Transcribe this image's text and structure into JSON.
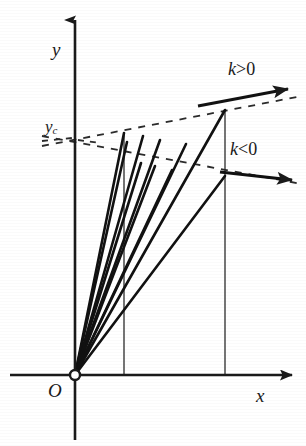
{
  "figure": {
    "background": "#ffffff",
    "ink_color": "#1a1a1a",
    "width": 306,
    "height": 446
  },
  "labels": {
    "y_axis": "y",
    "x_axis": "x",
    "origin": "O",
    "y_c": "y",
    "y_c_subscript": "c",
    "k_positive": "k>0",
    "k_positive_symbol": "k",
    "k_positive_operator": ">",
    "k_positive_value": "0",
    "k_negative": "k<0",
    "k_negative_symbol": "k",
    "k_negative_operator": "<",
    "k_negative_value": "0"
  },
  "chart_data": {
    "type": "line",
    "xlabel": "x",
    "ylabel": "y",
    "grid": false,
    "legend": null,
    "annotations": [
      {
        "name": "k-positive-arrow",
        "text": "k>0",
        "x": 228,
        "y": 60
      },
      {
        "name": "k-negative-arrow",
        "text": "k<0",
        "x": 230,
        "y": 140
      },
      {
        "name": "y-c-tick",
        "text": "y_c",
        "x": 45,
        "y": 118
      },
      {
        "name": "origin",
        "text": "O",
        "x": 48,
        "y": 381
      }
    ],
    "axes": {
      "origin_px": [
        75,
        375
      ],
      "y_axis": {
        "x": 75,
        "from_y": 440,
        "to_y": 20,
        "arrow": "up"
      },
      "x_axis": {
        "y": 375,
        "from_x": 10,
        "to_x": 292,
        "arrow": "right"
      }
    },
    "origin_marker": {
      "cx": 75,
      "cy": 375,
      "r": 5,
      "fill": "#ffffff"
    },
    "rays": [
      {
        "name": "ray-1",
        "x1": 75,
        "y1": 375,
        "x2": 124,
        "y2": 133
      },
      {
        "name": "ray-2",
        "x1": 75,
        "y1": 375,
        "x2": 127,
        "y2": 142
      },
      {
        "name": "ray-3",
        "x1": 75,
        "y1": 375,
        "x2": 143,
        "y2": 136
      },
      {
        "name": "ray-4",
        "x1": 75,
        "y1": 375,
        "x2": 160,
        "y2": 140
      },
      {
        "name": "ray-5",
        "x1": 75,
        "y1": 375,
        "x2": 186,
        "y2": 144
      },
      {
        "name": "ray-6",
        "x1": 75,
        "y1": 375,
        "x2": 225,
        "y2": 110
      },
      {
        "name": "ray-7",
        "x1": 75,
        "y1": 375,
        "x2": 141,
        "y2": 163
      },
      {
        "name": "ray-8",
        "x1": 75,
        "y1": 375,
        "x2": 155,
        "y2": 166
      },
      {
        "name": "ray-9",
        "x1": 75,
        "y1": 375,
        "x2": 172,
        "y2": 170
      },
      {
        "name": "ray-10",
        "x1": 75,
        "y1": 375,
        "x2": 225,
        "y2": 176
      }
    ],
    "verticals": [
      {
        "name": "vertical-line-1",
        "x": 124,
        "y_top": 133,
        "y_bottom": 375
      },
      {
        "name": "vertical-line-2",
        "x": 225,
        "y_top": 110,
        "y_bottom": 375
      }
    ],
    "dashed_lines": [
      {
        "name": "upper-slope-dashed",
        "x1": 42,
        "y1": 146,
        "x2": 302,
        "y2": 96,
        "slope_sign": "positive"
      },
      {
        "name": "lower-slope-dashed",
        "x1": 42,
        "y1": 136,
        "x2": 302,
        "y2": 184,
        "slope_sign": "negative"
      }
    ],
    "slope_arrows": [
      {
        "name": "k-positive-arrow-shaft",
        "x1": 198,
        "y1": 106,
        "x2": 288,
        "y2": 89
      },
      {
        "name": "k-negative-arrow-shaft",
        "x1": 220,
        "y1": 172,
        "x2": 292,
        "y2": 180
      }
    ],
    "y_c_ticks": [
      {
        "name": "y-c-tick-mark-left",
        "x1": 42,
        "y1": 141,
        "x2": 72,
        "y2": 138
      },
      {
        "name": "y-c-tick-mark-right",
        "x1": 78,
        "y1": 140,
        "x2": 100,
        "y2": 143
      }
    ]
  }
}
